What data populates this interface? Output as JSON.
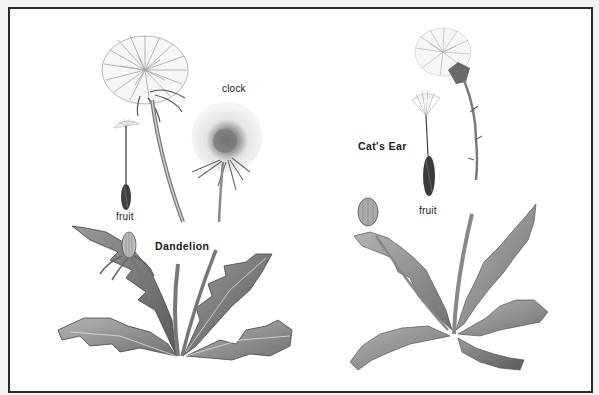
{
  "plate": {
    "background": "#ffffff",
    "border_color": "#2a2a2a",
    "page_background": "#f3f3f3"
  },
  "labels": {
    "clock": "clock",
    "dandelion_fruit": "fruit",
    "dandelion": "Dandelion",
    "cats_ear": "Cat's Ear",
    "cats_ear_fruit": "fruit"
  },
  "illustrations": [
    {
      "name": "Dandelion",
      "parts": [
        "flower head",
        "clock (seed head)",
        "fruit (achene with pappus)",
        "rosette of toothed leaves",
        "flower bud"
      ]
    },
    {
      "name": "Cat's Ear",
      "parts": [
        "flower head on branched stem",
        "fruit (achene with pappus)",
        "rosette of wavy hairy leaves",
        "flower bud"
      ]
    }
  ]
}
